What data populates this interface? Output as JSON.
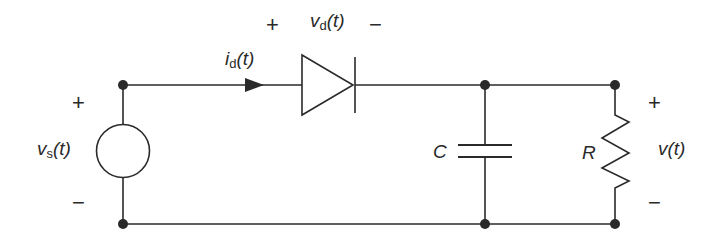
{
  "diagram": {
    "type": "circuit",
    "components": [
      {
        "id": "source",
        "kind": "voltage-source",
        "label": "v",
        "subscript": "s",
        "suffix": "(t)",
        "plus": "+",
        "minus": "−"
      },
      {
        "id": "diode",
        "kind": "diode",
        "voltage_label": "v",
        "voltage_subscript": "d",
        "voltage_suffix": "(t)",
        "plus": "+",
        "minus": "−",
        "current_label": "i",
        "current_subscript": "d",
        "current_suffix": "(t)"
      },
      {
        "id": "capacitor",
        "kind": "capacitor",
        "label": "C"
      },
      {
        "id": "resistor",
        "kind": "resistor",
        "label": "R"
      },
      {
        "id": "output",
        "kind": "output-voltage",
        "label": "v(t)",
        "plus": "+",
        "minus": "−"
      }
    ],
    "colors": {
      "stroke": "#2a2a2a",
      "background": "#ffffff"
    }
  }
}
